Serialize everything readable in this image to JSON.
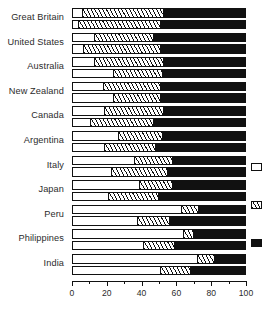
{
  "chart_data": {
    "type": "bar",
    "orientation": "horizontal",
    "stacked": true,
    "normalized_percent": true,
    "title": "",
    "subtitle": "",
    "xlabel": "",
    "ylabel": "",
    "xlim": [
      0,
      100
    ],
    "xticks": [
      0,
      20,
      40,
      60,
      80,
      100
    ],
    "xtick_labels": [
      "0",
      "20",
      "40",
      "60",
      "80",
      "100"
    ],
    "grid": false,
    "legend_position": "right",
    "legend_clipped": true,
    "categories": [
      "Great Britain",
      "United States",
      "Australia",
      "New Zealand",
      "Canada",
      "Argentina",
      "Italy",
      "Japan",
      "Peru",
      "Philippines",
      "India"
    ],
    "series": [
      {
        "name": "",
        "pattern": "white",
        "color": "#ffffff"
      },
      {
        "name": "",
        "pattern": "hatched",
        "color": "#ffffff"
      },
      {
        "name": "",
        "pattern": "solid-black",
        "color": "#111111"
      }
    ],
    "bars_per_category": 2,
    "groups": [
      {
        "category": "Great Britain",
        "bars": [
          {
            "segments": [
              5,
              47,
              48
            ]
          },
          {
            "segments": [
              3,
              47,
              50
            ]
          }
        ]
      },
      {
        "category": "United States",
        "bars": [
          {
            "segments": [
              12,
              34,
              54
            ]
          },
          {
            "segments": [
              6,
              44,
              50
            ]
          }
        ]
      },
      {
        "category": "Australia",
        "bars": [
          {
            "segments": [
              12,
              40,
              48
            ]
          },
          {
            "segments": [
              23,
              28,
              49
            ]
          }
        ]
      },
      {
        "category": "New Zealand",
        "bars": [
          {
            "segments": [
              17,
              33,
              50
            ]
          },
          {
            "segments": [
              23,
              27,
              50
            ]
          }
        ]
      },
      {
        "category": "Canada",
        "bars": [
          {
            "segments": [
              18,
              34,
              48
            ]
          },
          {
            "segments": [
              10,
              36,
              54
            ]
          }
        ]
      },
      {
        "category": "Argentina",
        "bars": [
          {
            "segments": [
              26,
              25,
              49
            ]
          },
          {
            "segments": [
              18,
              29,
              53
            ]
          }
        ]
      },
      {
        "category": "Italy",
        "bars": [
          {
            "segments": [
              35,
              22,
              43
            ]
          },
          {
            "segments": [
              22,
              32,
              46
            ]
          }
        ]
      },
      {
        "category": "Japan",
        "bars": [
          {
            "segments": [
              38,
              19,
              43
            ]
          },
          {
            "segments": [
              20,
              29,
              51
            ]
          }
        ]
      },
      {
        "category": "Peru",
        "bars": [
          {
            "segments": [
              62,
              10,
              28
            ]
          },
          {
            "segments": [
              37,
              18,
              45
            ]
          }
        ]
      },
      {
        "category": "Philippines",
        "bars": [
          {
            "segments": [
              63,
              6,
              31
            ]
          },
          {
            "segments": [
              40,
              18,
              42
            ]
          }
        ]
      },
      {
        "category": "India",
        "bars": [
          {
            "segments": [
              71,
              10,
              19
            ]
          },
          {
            "segments": [
              50,
              17,
              33
            ]
          }
        ]
      }
    ],
    "legend_entries": [
      {
        "pattern": "white",
        "label": ""
      },
      {
        "pattern": "hatched",
        "label": ""
      },
      {
        "pattern": "solid-black",
        "label": ""
      }
    ]
  },
  "colors": {
    "ink": "#111111",
    "text": "#2b2b2b",
    "background": "#ffffff"
  }
}
